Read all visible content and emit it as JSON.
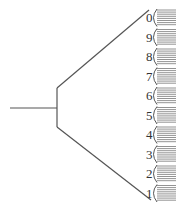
{
  "diagram": {
    "labels": [
      "0",
      "9",
      "8",
      "7",
      "6",
      "5",
      "4",
      "3",
      "2",
      "1"
    ],
    "colors": {
      "line": "#555555",
      "hatch": "#777777",
      "text": "#333333"
    }
  }
}
